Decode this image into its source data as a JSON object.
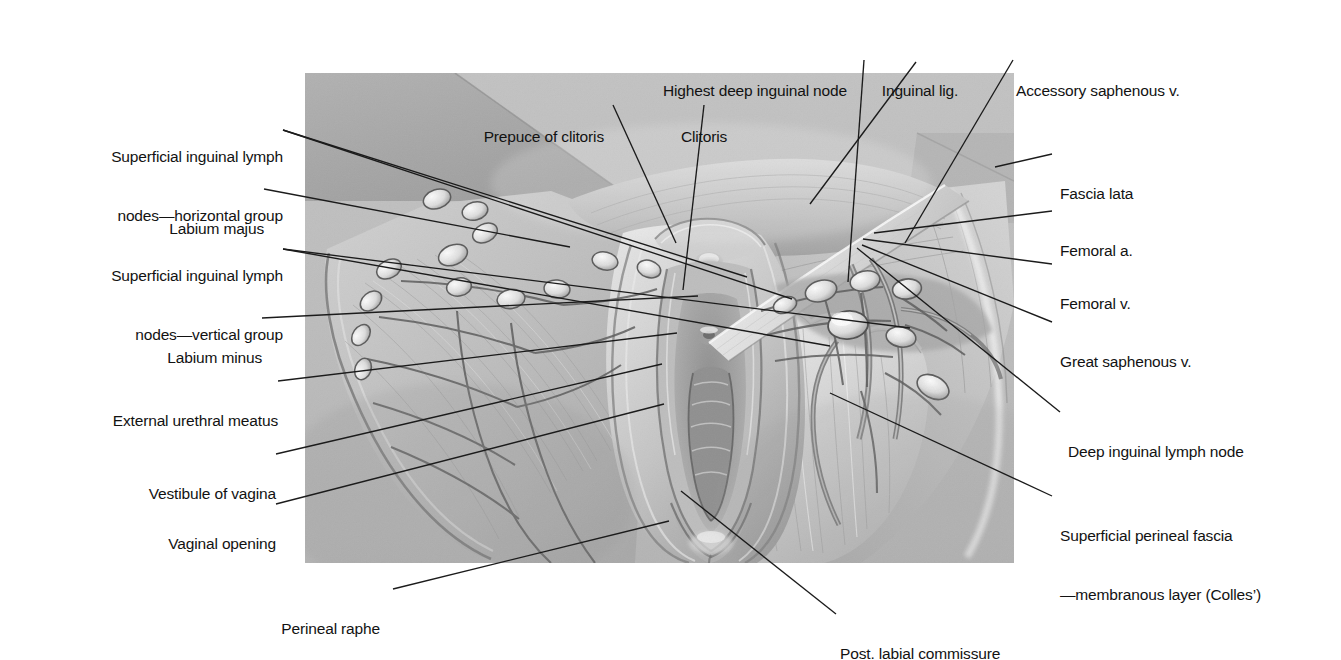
{
  "figure": {
    "type": "anatomical-illustration",
    "style": "grayscale-halftone",
    "image_region": {
      "x": 305,
      "y": 73,
      "width": 709,
      "height": 490
    },
    "background_color": "#ffffff",
    "illustration_base_color": "#b9b9b9",
    "line_color": "#1b1b1b"
  },
  "labels": {
    "left": [
      {
        "id": "superficial-inguinal-lymph-nodes-horizontal-group",
        "line1": "Superficial inguinal lymph",
        "line2": "nodes—horizontal group",
        "text": "Superficial inguinal lymph nodes—horizontal group",
        "anchor_x": 268,
        "anchor_y": 129,
        "targets": [
          [
            442,
            204
          ],
          [
            487,
            226
          ]
        ]
      },
      {
        "id": "labium-majus",
        "line1": "Labium majus",
        "text": "Labium majus",
        "anchor_x": 249,
        "anchor_y": 190,
        "targets": [
          [
            436,
            243
          ]
        ]
      },
      {
        "id": "superficial-inguinal-lymph-nodes-vertical-group",
        "line1": "Superficial inguinal lymph",
        "line2": "nodes—vertical group",
        "text": "Superficial inguinal lymph nodes—vertical group",
        "anchor_x": 268,
        "anchor_y": 248,
        "targets": [
          [
            525,
            273
          ],
          [
            605,
            255
          ]
        ]
      },
      {
        "id": "labium-minus",
        "line1": "Labium minus",
        "text": "Labium minus",
        "anchor_x": 247,
        "anchor_y": 319,
        "targets": [
          [
            693,
            303
          ]
        ]
      },
      {
        "id": "external-urethral-meatus",
        "line1": "External urethral meatus",
        "text": "External urethral meatus",
        "anchor_x": 263,
        "anchor_y": 382,
        "targets": [
          [
            672,
            340
          ]
        ]
      },
      {
        "id": "vestibule-of-vagina",
        "line1": "Vestibule of vagina",
        "text": "Vestibule of vagina",
        "anchor_x": 261,
        "anchor_y": 455,
        "targets": [
          [
            657,
            371
          ]
        ]
      },
      {
        "id": "vaginal-opening",
        "line1": "Vaginal opening",
        "text": "Vaginal opening",
        "anchor_x": 261,
        "anchor_y": 505,
        "targets": [
          [
            659,
            411
          ]
        ]
      }
    ],
    "top": [
      {
        "id": "prepuce-of-clitoris",
        "line1": "Prepuce of clitoris",
        "text": "Prepuce of clitoris",
        "anchor_x": 600,
        "anchor_y": 97,
        "targets": [
          [
            671,
            250
          ]
        ]
      },
      {
        "id": "highest-deep-inguinal-node",
        "line1": "Highest deep inguinal node",
        "text": "Highest deep inguinal node",
        "anchor_x": 755,
        "anchor_y": 52,
        "targets": [
          [
            778,
            289
          ]
        ]
      },
      {
        "id": "clitoris",
        "line1": "Clitoris",
        "text": "Clitoris",
        "anchor_x": 704,
        "anchor_y": 97,
        "targets": [
          [
            678,
            297
          ]
        ]
      },
      {
        "id": "inguinal-lig",
        "line1": "Inguinal lig.",
        "text": "Inguinal lig.",
        "anchor_x": 920,
        "anchor_y": 52,
        "targets": [
          [
            805,
            211
          ]
        ]
      },
      {
        "id": "accessory-saphenous-v",
        "line1": "Accessory saphenous v.",
        "text": "Accessory saphenous v.",
        "anchor_x": 1113,
        "anchor_y": 52,
        "targets": [
          [
            900,
            250
          ]
        ]
      }
    ],
    "right": [
      {
        "id": "fascia-lata",
        "line1": "Fascia lata",
        "text": "Fascia lata",
        "anchor_x": 1062,
        "anchor_y": 155,
        "targets": [
          [
            990,
            174
          ]
        ]
      },
      {
        "id": "femoral-a",
        "line1": "Femoral a.",
        "text": "Femoral a.",
        "anchor_x": 1062,
        "anchor_y": 212,
        "targets": [
          [
            869,
            240
          ]
        ]
      },
      {
        "id": "femoral-v",
        "line1": "Femoral v.",
        "text": "Femoral v.",
        "anchor_x": 1062,
        "anchor_y": 265,
        "targets": [
          [
            858,
            246
          ]
        ]
      },
      {
        "id": "great-saphenous-v",
        "line1": "Great saphenous v.",
        "text": "Great saphenous v.",
        "anchor_x": 1062,
        "anchor_y": 323,
        "targets": [
          [
            857,
            252
          ]
        ]
      },
      {
        "id": "deep-inguinal-lymph-node",
        "line1": "Deep inguinal lymph node",
        "text": "Deep inguinal lymph node",
        "anchor_x": 1070,
        "anchor_y": 413,
        "targets": [
          [
            852,
            255
          ]
        ]
      },
      {
        "id": "superficial-perineal-fascia",
        "line1": "Superficial perineal fascia",
        "line2": "—membranous layer (Colles’)",
        "text": "Superficial perineal fascia—membranous layer (Colles’)",
        "anchor_x": 1062,
        "anchor_y": 503,
        "targets": [
          [
            825,
            400
          ]
        ]
      }
    ],
    "bottom": [
      {
        "id": "perineal-raphe",
        "line1": "Perineal raphe",
        "text": "Perineal raphe",
        "anchor_x": 381,
        "anchor_y": 595,
        "targets": [
          [
            664,
            528
          ]
        ]
      },
      {
        "id": "post-labial-commissure",
        "line1": "Post. labial commissure",
        "text": "Post. labial commissure",
        "anchor_x": 846,
        "anchor_y": 620,
        "targets": [
          [
            676,
            498
          ]
        ]
      }
    ]
  }
}
